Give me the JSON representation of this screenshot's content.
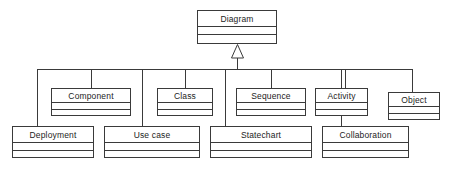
{
  "diagram": {
    "notation": "uml-class-diagram",
    "colors": {
      "stroke": "#3a3a3a",
      "fill": "#ffffff",
      "text": "#1c1c1c",
      "background": "#ffffff"
    },
    "root": {
      "label": "Diagram",
      "x": 197,
      "y": 10,
      "width": 80,
      "height": 34,
      "name_height": 16,
      "attrs_height": 8
    },
    "generalization": {
      "kind": "generalization-arrow",
      "tip_x": 237,
      "tip_y": 44,
      "base_y": 58,
      "half_width": 6,
      "stem_from_y": 58,
      "stem_to_y": 69
    },
    "bus": {
      "y": 69,
      "x_start": 37,
      "x_end": 412
    },
    "subclasses": [
      {
        "label": "Component",
        "row": "middle",
        "x": 51,
        "y": 88,
        "width": 80,
        "height": 28,
        "name_height": 14,
        "attrs_height": 7,
        "drop_x": 91
      },
      {
        "label": "Class",
        "row": "middle",
        "x": 157,
        "y": 88,
        "width": 56,
        "height": 28,
        "name_height": 14,
        "attrs_height": 7,
        "drop_x": 185
      },
      {
        "label": "Sequence",
        "row": "middle",
        "x": 236,
        "y": 88,
        "width": 70,
        "height": 28,
        "name_height": 14,
        "attrs_height": 7,
        "drop_x": 271
      },
      {
        "label": "Activity",
        "row": "middle",
        "x": 315,
        "y": 88,
        "width": 53,
        "height": 28,
        "name_height": 14,
        "attrs_height": 7,
        "drop_x": 345
      },
      {
        "label": "Object",
        "row": "middle",
        "x": 388,
        "y": 92,
        "width": 52,
        "height": 28,
        "name_height": 14,
        "attrs_height": 7,
        "drop_x": 412
      },
      {
        "label": "Deployment",
        "row": "bottom",
        "x": 12,
        "y": 126,
        "width": 82,
        "height": 32,
        "name_height": 16,
        "attrs_height": 8,
        "drop_x": 37
      },
      {
        "label": "Use case",
        "row": "bottom",
        "x": 104,
        "y": 126,
        "width": 96,
        "height": 32,
        "name_height": 16,
        "attrs_height": 8,
        "drop_x": 142
      },
      {
        "label": "Statechart",
        "row": "bottom",
        "x": 210,
        "y": 126,
        "width": 102,
        "height": 32,
        "name_height": 16,
        "attrs_height": 8,
        "drop_x": 225
      },
      {
        "label": "Collaboration",
        "row": "bottom",
        "x": 322,
        "y": 126,
        "width": 87,
        "height": 32,
        "name_height": 16,
        "attrs_height": 8,
        "drop_x": 341
      }
    ]
  }
}
